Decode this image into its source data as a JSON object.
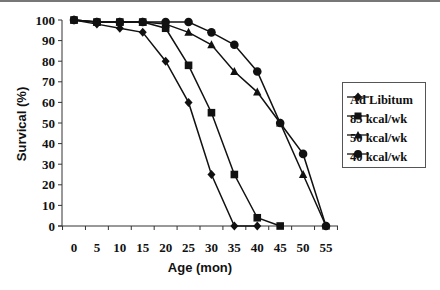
{
  "chart_data": {
    "type": "line",
    "title": "",
    "xlabel": "Age (mon)",
    "ylabel": "Survical (%)",
    "x": [
      0,
      5,
      10,
      15,
      20,
      25,
      30,
      35,
      40,
      45,
      50,
      55
    ],
    "xlim": [
      0,
      55
    ],
    "ylim": [
      0,
      100
    ],
    "xticks": [
      "0",
      "5",
      "10",
      "15",
      "20",
      "25",
      "30",
      "35",
      "40",
      "45",
      "50",
      "55"
    ],
    "yticks": [
      "0",
      "10",
      "20",
      "30",
      "40",
      "50",
      "60",
      "70",
      "80",
      "90",
      "100"
    ],
    "grid": false,
    "legend_position": "right",
    "series": [
      {
        "name": "Ad Libitum",
        "marker": "diamond",
        "x": [
          0,
          5,
          10,
          15,
          20,
          25,
          30,
          35,
          40
        ],
        "values": [
          100,
          98,
          96,
          94,
          80,
          60,
          25,
          0,
          0
        ]
      },
      {
        "name": "85 kcal/wk",
        "marker": "square",
        "x": [
          0,
          5,
          10,
          15,
          20,
          25,
          30,
          35,
          40,
          45
        ],
        "values": [
          100,
          99,
          99,
          99,
          96,
          78,
          55,
          25,
          4,
          0
        ]
      },
      {
        "name": "50 kcal/wk",
        "marker": "triangle",
        "x": [
          0,
          5,
          10,
          15,
          20,
          25,
          30,
          35,
          40,
          45,
          50,
          55
        ],
        "values": [
          100,
          99,
          99,
          99,
          98,
          94,
          88,
          75,
          65,
          50,
          25,
          0
        ]
      },
      {
        "name": "40 kcal/wk",
        "marker": "circle",
        "x": [
          0,
          5,
          10,
          15,
          20,
          25,
          30,
          35,
          40,
          45,
          50,
          55
        ],
        "values": [
          100,
          99,
          99,
          99,
          99,
          99,
          94,
          88,
          75,
          50,
          35,
          0
        ]
      }
    ]
  },
  "legend": {
    "items": [
      {
        "label": "Ad Libitum"
      },
      {
        "label": "85 kcal/wk"
      },
      {
        "label": "50 kcal/wk"
      },
      {
        "label": "40 kcal/wk"
      }
    ]
  }
}
